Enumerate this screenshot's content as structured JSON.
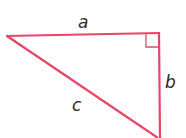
{
  "diagram": {
    "type": "right-triangle",
    "stroke_color": "#e8456a",
    "label_color": "#2a2a2a",
    "vertices": {
      "left": [
        6,
        36
      ],
      "right_angle": [
        159,
        33
      ],
      "bottom": [
        159,
        138
      ]
    },
    "sides": {
      "a": "a",
      "b": "b",
      "c": "c"
    },
    "right_angle_marker": true
  }
}
